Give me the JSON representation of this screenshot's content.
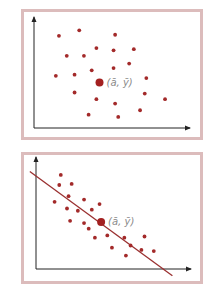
{
  "colors": {
    "point": "#a32a2a",
    "mean_point": "#a32020",
    "line": "#9a3030",
    "axis": "#222222",
    "frame": "#dcbcbc",
    "label": "#8a8a8a"
  },
  "chart_data": [
    {
      "type": "scatter",
      "title": "",
      "xlabel": "",
      "ylabel": "",
      "xlim": [
        0,
        100
      ],
      "ylim": [
        0,
        100
      ],
      "grid": false,
      "mean_label": "(ā, ȳ)",
      "mean": [
        42,
        41
      ],
      "points": [
        [
          16,
          83
        ],
        [
          29,
          88
        ],
        [
          52,
          84
        ],
        [
          21,
          65
        ],
        [
          32,
          65
        ],
        [
          40,
          72
        ],
        [
          51,
          70
        ],
        [
          64,
          71
        ],
        [
          37,
          52
        ],
        [
          51,
          54
        ],
        [
          61,
          58
        ],
        [
          14,
          47
        ],
        [
          26,
          48
        ],
        [
          72,
          45
        ],
        [
          26,
          32
        ],
        [
          40,
          26
        ],
        [
          52,
          22
        ],
        [
          71,
          31
        ],
        [
          84,
          26
        ],
        [
          35,
          12
        ],
        [
          54,
          10
        ],
        [
          68,
          16
        ]
      ],
      "regression_line": null
    },
    {
      "type": "scatter",
      "title": "",
      "xlabel": "",
      "ylabel": "",
      "xlim": [
        0,
        100
      ],
      "ylim": [
        0,
        100
      ],
      "grid": false,
      "mean_label": "(ā, ȳ)",
      "mean": [
        42,
        42
      ],
      "points": [
        [
          16,
          84
        ],
        [
          15,
          75
        ],
        [
          23,
          76
        ],
        [
          21,
          65
        ],
        [
          12,
          60
        ],
        [
          20,
          54
        ],
        [
          31,
          62
        ],
        [
          41,
          58
        ],
        [
          27,
          52
        ],
        [
          36,
          53
        ],
        [
          22,
          43
        ],
        [
          31,
          41
        ],
        [
          34,
          36
        ],
        [
          38,
          28
        ],
        [
          46,
          30
        ],
        [
          49,
          19
        ],
        [
          57,
          28
        ],
        [
          61,
          21
        ],
        [
          70,
          29
        ],
        [
          58,
          12
        ],
        [
          68,
          17
        ],
        [
          76,
          16
        ]
      ],
      "regression_line": {
        "x1": -4,
        "y1": 87,
        "x2": 88,
        "y2": -6
      }
    }
  ]
}
